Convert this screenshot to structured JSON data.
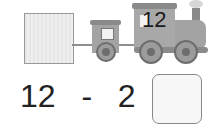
{
  "train": {
    "locomotive_number": "12",
    "cars": [
      {
        "type": "box-car",
        "fill": "#e6e6e6"
      },
      {
        "type": "passenger-car",
        "fill": "#a3a3a3"
      }
    ]
  },
  "equation": {
    "minuend": "12",
    "operator": "-",
    "subtrahend": "2",
    "equals": "=",
    "answer": ""
  },
  "colors": {
    "train_gray": "#a3a3a3",
    "dark_gray": "#6d6d6d",
    "text": "#222222"
  }
}
